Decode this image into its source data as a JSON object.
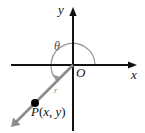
{
  "figure": {
    "kind": "coordinate-plane-angle-diagram",
    "background_color": "#ffffff",
    "axis_color": "#111111",
    "ray_color": "#8c8c8c",
    "arc_color": "#9a9a9a",
    "point_color": "#000000"
  },
  "axes": {
    "y_axis_label": "y",
    "x_axis_label": "x",
    "origin_label": "O"
  },
  "angle": {
    "label": "θ",
    "description": "angle in standard position swept from positive x-axis to terminal ray",
    "start_degrees": 0,
    "end_degrees": 215,
    "direction": "counterclockwise"
  },
  "ray": {
    "label": "r",
    "description": "terminal ray from origin through P into third quadrant"
  },
  "point": {
    "name": "P",
    "open_paren": "(",
    "x_var": "x",
    "comma": ", ",
    "y_var": "y",
    "close_paren": ")",
    "full_label": "P(x, y)",
    "quadrant": 3
  }
}
